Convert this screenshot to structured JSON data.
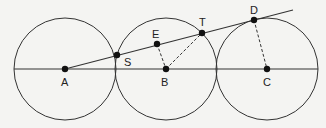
{
  "diagram": {
    "colors": {
      "background": "#f4f4f2",
      "stroke": "#333333",
      "point": "#111111"
    },
    "circles": [
      {
        "id": "circle-A",
        "cx": 65,
        "cy": 69,
        "r": 51
      },
      {
        "id": "circle-B",
        "cx": 166,
        "cy": 69,
        "r": 51
      },
      {
        "id": "circle-C",
        "cx": 267,
        "cy": 69,
        "r": 51
      }
    ],
    "baseline": {
      "x1": 14,
      "y1": 69,
      "x2": 318,
      "y2": 69
    },
    "secant": {
      "x1": 65,
      "y1": 69,
      "x2": 293,
      "y2": 10
    },
    "dashed_segments": [
      {
        "id": "EB",
        "x1": 157,
        "y1": 44,
        "x2": 166,
        "y2": 69
      },
      {
        "id": "BT",
        "x1": 166,
        "y1": 69,
        "x2": 202,
        "y2": 33
      },
      {
        "id": "DC",
        "x1": 254,
        "y1": 20,
        "x2": 267,
        "y2": 69
      }
    ],
    "points": [
      {
        "name": "A",
        "x": 65,
        "y": 69,
        "lx": 61,
        "ly": 86
      },
      {
        "name": "S",
        "x": 117,
        "y": 55,
        "lx": 124,
        "ly": 66,
        "label_offset": true
      },
      {
        "name": "E",
        "x": 157,
        "y": 44,
        "lx": 152,
        "ly": 38
      },
      {
        "name": "B",
        "x": 166,
        "y": 69,
        "lx": 161,
        "ly": 86
      },
      {
        "name": "T",
        "x": 202,
        "y": 33,
        "lx": 199,
        "ly": 26
      },
      {
        "name": "D",
        "x": 254,
        "y": 20,
        "lx": 250,
        "ly": 14
      },
      {
        "name": "C",
        "x": 267,
        "y": 69,
        "lx": 263,
        "ly": 86
      }
    ],
    "labels": {
      "A": "A",
      "S": "S",
      "E": "E",
      "B": "B",
      "T": "T",
      "D": "D",
      "C": "C"
    }
  }
}
